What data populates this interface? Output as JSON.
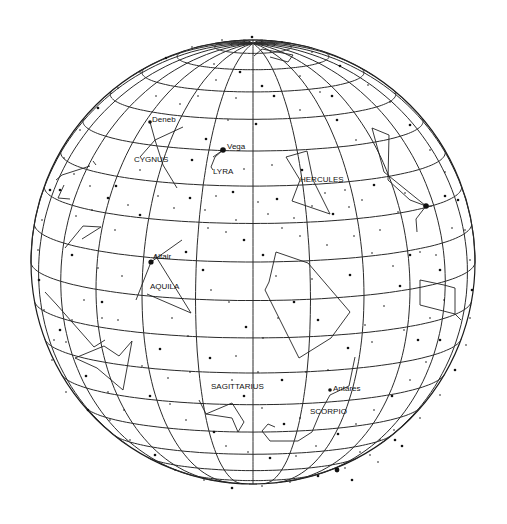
{
  "globe": {
    "center": [
      253,
      262
    ],
    "radius": 222,
    "view_latitude_deg": 10,
    "latitude_step_deg": 10,
    "longitude_step_deg": 15,
    "line_color": "#2a2a2a",
    "star_color": "#111111"
  },
  "labels": [
    {
      "text": "Deneb",
      "x": 152,
      "y": 122
    },
    {
      "text": "CYGNUS",
      "x": 134,
      "y": 162
    },
    {
      "text": "Vega",
      "x": 227,
      "y": 149
    },
    {
      "text": "LYRA",
      "x": 213,
      "y": 174
    },
    {
      "text": "HERCULES",
      "x": 300,
      "y": 182
    },
    {
      "text": "Altair",
      "x": 153,
      "y": 259
    },
    {
      "text": "AQUILA",
      "x": 150,
      "y": 289
    },
    {
      "text": "SAGITTARIUS",
      "x": 211,
      "y": 389
    },
    {
      "text": "Antares",
      "x": 333,
      "y": 391
    },
    {
      "text": "SCORPIO",
      "x": 310,
      "y": 414
    }
  ],
  "bright_stars": [
    {
      "name": "Deneb",
      "x": 150,
      "y": 122,
      "r": 1.8
    },
    {
      "name": "Vega",
      "x": 223,
      "y": 150,
      "r": 2.8
    },
    {
      "name": "Altair",
      "x": 151,
      "y": 262,
      "r": 2.6
    },
    {
      "name": "Antares",
      "x": 330,
      "y": 390,
      "r": 1.8
    },
    {
      "name": "Arcturus",
      "x": 426,
      "y": 206,
      "r": 2.8
    },
    {
      "name": "Fomalhaut",
      "x": 337,
      "y": 470,
      "r": 2.4
    }
  ],
  "constellation_lines": [
    [
      [
        150,
        122
      ],
      [
        155,
        140
      ],
      [
        163,
        165
      ],
      [
        177,
        188
      ]
    ],
    [
      [
        183,
        127
      ],
      [
        155,
        140
      ],
      [
        140,
        157
      ]
    ],
    [
      [
        93,
        161
      ],
      [
        96,
        165
      ]
    ],
    [
      [
        223,
        150
      ],
      [
        215,
        157
      ],
      [
        211,
        167
      ],
      [
        213,
        170
      ]
    ],
    [
      [
        223,
        150
      ],
      [
        213,
        157
      ]
    ],
    [
      [
        286,
        157
      ],
      [
        307,
        151
      ],
      [
        313,
        180
      ],
      [
        330,
        214
      ],
      [
        292,
        201
      ],
      [
        300,
        180
      ],
      [
        286,
        157
      ]
    ],
    [
      [
        182,
        240
      ],
      [
        151,
        262
      ],
      [
        136,
        300
      ]
    ],
    [
      [
        155,
        255
      ],
      [
        191,
        313
      ]
    ],
    [
      [
        147,
        294
      ],
      [
        191,
        313
      ]
    ],
    [
      [
        276,
        252
      ],
      [
        308,
        263
      ],
      [
        350,
        312
      ],
      [
        331,
        338
      ],
      [
        299,
        358
      ],
      [
        265,
        290
      ],
      [
        269,
        282
      ],
      [
        276,
        252
      ]
    ],
    [
      [
        199,
        400
      ],
      [
        206,
        414
      ],
      [
        232,
        403
      ],
      [
        244,
        422
      ],
      [
        238,
        432
      ],
      [
        232,
        418
      ],
      [
        206,
        414
      ]
    ],
    [
      [
        355,
        357
      ],
      [
        349,
        386
      ],
      [
        330,
        395
      ],
      [
        320,
        413
      ],
      [
        312,
        432
      ],
      [
        298,
        441
      ],
      [
        270,
        441
      ],
      [
        262,
        431
      ],
      [
        268,
        424
      ],
      [
        275,
        427
      ]
    ],
    [
      [
        372,
        128
      ],
      [
        389,
        135
      ],
      [
        388,
        180
      ],
      [
        410,
        200
      ],
      [
        426,
        206
      ],
      [
        432,
        206
      ]
    ],
    [
      [
        372,
        128
      ],
      [
        384,
        172
      ],
      [
        426,
        206
      ]
    ],
    [
      [
        426,
        206
      ],
      [
        416,
        219
      ],
      [
        417,
        232
      ]
    ],
    [
      [
        420,
        280
      ],
      [
        420,
        305
      ],
      [
        455,
        314
      ],
      [
        455,
        288
      ],
      [
        444,
        285
      ],
      [
        420,
        280
      ]
    ],
    [
      [
        455,
        314
      ],
      [
        461,
        320
      ]
    ],
    [
      [
        82,
        239
      ],
      [
        101,
        227
      ],
      [
        83,
        226
      ],
      [
        65,
        248
      ]
    ],
    [
      [
        45,
        292
      ],
      [
        57,
        305
      ],
      [
        94,
        347
      ],
      [
        105,
        340
      ]
    ],
    [
      [
        75,
        358
      ],
      [
        104,
        346
      ],
      [
        119,
        356
      ],
      [
        132,
        341
      ],
      [
        123,
        390
      ],
      [
        97,
        368
      ],
      [
        75,
        358
      ]
    ],
    [
      [
        56,
        180
      ],
      [
        62,
        175
      ],
      [
        90,
        166
      ]
    ],
    [
      [
        64,
        185
      ],
      [
        58,
        198
      ],
      [
        70,
        199
      ]
    ],
    [
      [
        254,
        56
      ],
      [
        262,
        49
      ],
      [
        293,
        55
      ],
      [
        288,
        62
      ],
      [
        270,
        57
      ]
    ]
  ],
  "stars": [
    [
      60,
      190
    ],
    [
      74,
      174
    ],
    [
      92,
      210
    ],
    [
      108,
      198
    ],
    [
      128,
      205
    ],
    [
      115,
      230
    ],
    [
      140,
      215
    ],
    [
      158,
      196
    ],
    [
      174,
      208
    ],
    [
      190,
      198
    ],
    [
      205,
      210
    ],
    [
      216,
      196
    ],
    [
      233,
      192
    ],
    [
      258,
      202
    ],
    [
      268,
      214
    ],
    [
      277,
      199
    ],
    [
      294,
      218
    ],
    [
      312,
      206
    ],
    [
      333,
      214
    ],
    [
      349,
      207
    ],
    [
      362,
      200
    ],
    [
      374,
      185
    ],
    [
      398,
      212
    ],
    [
      405,
      193
    ],
    [
      445,
      196
    ],
    [
      452,
      228
    ],
    [
      436,
      255
    ],
    [
      410,
      255
    ],
    [
      393,
      266
    ],
    [
      372,
      253
    ],
    [
      350,
      275
    ],
    [
      327,
      245
    ],
    [
      312,
      279
    ],
    [
      294,
      302
    ],
    [
      278,
      318
    ],
    [
      263,
      338
    ],
    [
      246,
      327
    ],
    [
      229,
      302
    ],
    [
      211,
      290
    ],
    [
      203,
      270
    ],
    [
      188,
      336
    ],
    [
      172,
      318
    ],
    [
      160,
      349
    ],
    [
      142,
      366
    ],
    [
      118,
      320
    ],
    [
      102,
      302
    ],
    [
      84,
      300
    ],
    [
      72,
      320
    ],
    [
      60,
      330
    ],
    [
      52,
      360
    ],
    [
      66,
      392
    ],
    [
      88,
      410
    ],
    [
      110,
      420
    ],
    [
      130,
      440
    ],
    [
      155,
      455
    ],
    [
      175,
      470
    ],
    [
      204,
      480
    ],
    [
      232,
      488
    ],
    [
      262,
      486
    ],
    [
      290,
      482
    ],
    [
      318,
      476
    ],
    [
      345,
      468
    ],
    [
      370,
      455
    ],
    [
      395,
      440
    ],
    [
      420,
      418
    ],
    [
      440,
      395
    ],
    [
      455,
      370
    ],
    [
      466,
      345
    ],
    [
      470,
      318
    ],
    [
      472,
      290
    ],
    [
      470,
      260
    ],
    [
      465,
      230
    ],
    [
      458,
      200
    ],
    [
      445,
      172
    ],
    [
      430,
      150
    ],
    [
      410,
      125
    ],
    [
      390,
      102
    ],
    [
      368,
      85
    ],
    [
      340,
      66
    ],
    [
      312,
      52
    ],
    [
      282,
      42
    ],
    [
      252,
      37
    ],
    [
      222,
      40
    ],
    [
      192,
      47
    ],
    [
      166,
      58
    ],
    [
      140,
      72
    ],
    [
      118,
      88
    ],
    [
      98,
      108
    ],
    [
      80,
      130
    ],
    [
      64,
      158
    ],
    [
      50,
      190
    ],
    [
      42,
      220
    ],
    [
      38,
      250
    ],
    [
      39,
      280
    ],
    [
      44,
      310
    ],
    [
      54,
      340
    ],
    [
      240,
      72
    ],
    [
      216,
      80
    ],
    [
      198,
      96
    ],
    [
      274,
      96
    ],
    [
      300,
      110
    ],
    [
      320,
      92
    ],
    [
      337,
      120
    ],
    [
      356,
      140
    ],
    [
      228,
      120
    ],
    [
      256,
      124
    ],
    [
      180,
      104
    ],
    [
      156,
      96
    ],
    [
      206,
      139
    ],
    [
      244,
      169
    ],
    [
      272,
      165
    ],
    [
      302,
      170
    ],
    [
      325,
      193
    ],
    [
      345,
      190
    ],
    [
      263,
      255
    ],
    [
      282,
      228
    ],
    [
      300,
      236
    ],
    [
      244,
      240
    ],
    [
      226,
      232
    ],
    [
      208,
      228
    ],
    [
      186,
      252
    ],
    [
      122,
      276
    ],
    [
      98,
      268
    ],
    [
      72,
      255
    ],
    [
      354,
      236
    ],
    [
      380,
      230
    ],
    [
      400,
      286
    ],
    [
      384,
      306
    ],
    [
      365,
      325
    ],
    [
      348,
      348
    ],
    [
      328,
      370
    ],
    [
      306,
      372
    ],
    [
      282,
      380
    ],
    [
      258,
      372
    ],
    [
      236,
      356
    ],
    [
      210,
      358
    ],
    [
      190,
      372
    ],
    [
      168,
      378
    ],
    [
      150,
      396
    ],
    [
      170,
      404
    ],
    [
      186,
      420
    ],
    [
      214,
      432
    ],
    [
      226,
      446
    ],
    [
      248,
      452
    ],
    [
      270,
      458
    ],
    [
      296,
      456
    ],
    [
      316,
      446
    ],
    [
      338,
      434
    ],
    [
      356,
      424
    ],
    [
      374,
      410
    ],
    [
      392,
      396
    ],
    [
      410,
      380
    ],
    [
      426,
      362
    ],
    [
      440,
      340
    ],
    [
      380,
      440
    ],
    [
      394,
      430
    ],
    [
      402,
      446
    ],
    [
      360,
      452
    ],
    [
      378,
      462
    ],
    [
      352,
      480
    ],
    [
      102,
      318
    ],
    [
      66,
      342
    ],
    [
      86,
      376
    ],
    [
      108,
      392
    ],
    [
      124,
      410
    ],
    [
      284,
      424
    ],
    [
      300,
      418
    ],
    [
      262,
      408
    ],
    [
      244,
      396
    ],
    [
      232,
      380
    ],
    [
      140,
      170
    ],
    [
      116,
      186
    ],
    [
      90,
      186
    ],
    [
      76,
      216
    ],
    [
      192,
      160
    ],
    [
      236,
      220
    ],
    [
      276,
      276
    ],
    [
      318,
      320
    ],
    [
      372,
      342
    ],
    [
      404,
      330
    ],
    [
      418,
      340
    ],
    [
      430,
      318
    ],
    [
      444,
      300
    ],
    [
      440,
      270
    ],
    [
      420,
      252
    ],
    [
      236,
      98
    ],
    [
      262,
      86
    ],
    [
      214,
      64
    ],
    [
      300,
      76
    ],
    [
      332,
      96
    ]
  ]
}
